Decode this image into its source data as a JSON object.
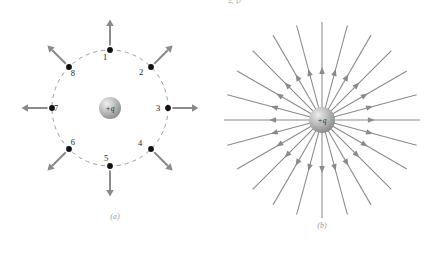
{
  "figure": {
    "top_clipped_text": "g           p",
    "background_color": "#ffffff",
    "arrow_color": "#8a8a8a",
    "dot_color": "#111111",
    "dash_color": "#9d9d9d",
    "caption_color": "#9a9a9a",
    "sphere": {
      "label": "+q",
      "highlight_color": "#e6e6e6",
      "mid_color": "#b4b4b4",
      "edge_color": "#8c8c8c"
    }
  },
  "panel_a": {
    "caption": "(a)",
    "center": {
      "x": 110,
      "y": 108
    },
    "charge_label": "+q",
    "circle_radius": 58,
    "points": [
      {
        "label": "1",
        "angle_deg": 90,
        "label_dx": -5,
        "label_dy": 10
      },
      {
        "label": "2",
        "angle_deg": 45,
        "label_dx": -10,
        "label_dy": 8
      },
      {
        "label": "3",
        "angle_deg": 0,
        "label_dx": -10,
        "label_dy": 3
      },
      {
        "label": "4",
        "angle_deg": -45,
        "label_dx": -11,
        "label_dy": -3
      },
      {
        "label": "5",
        "angle_deg": -90,
        "label_dx": -4,
        "label_dy": -5
      },
      {
        "label": "6",
        "angle_deg": -135,
        "label_dx": 4,
        "label_dy": -4
      },
      {
        "label": "7",
        "angle_deg": 180,
        "label_dx": 4,
        "label_dy": 3
      },
      {
        "label": "8",
        "angle_deg": 135,
        "label_dx": 4,
        "label_dy": 9
      }
    ],
    "vector_length": 26,
    "description": "Eight labeled points on a dashed circle around a positive point charge, each with an electric field vector pointing radially outward."
  },
  "panel_b": {
    "caption": "(b)",
    "center": {
      "x": 322,
      "y": 120
    },
    "charge_label": "+q",
    "line_count": 24,
    "line_length": 98,
    "sphere_radius": 13,
    "arrow_fraction": 0.46,
    "description": "Radial electric field lines emanating outward from a positive point charge, with arrowheads along each line."
  }
}
